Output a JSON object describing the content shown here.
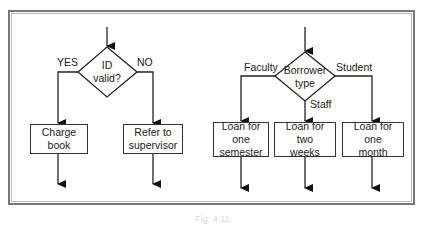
{
  "figure": {
    "caption": "Fig. 4.11",
    "colors": {
      "stroke": "#222222",
      "frame_outer": "#777777",
      "frame_inner": "#bbbbbb",
      "background": "#ffffff"
    }
  },
  "left_flowchart": {
    "decision": {
      "line1": "ID",
      "line2": "valid?"
    },
    "branches": [
      {
        "label": "YES",
        "box": {
          "line1": "Charge",
          "line2": "book"
        }
      },
      {
        "label": "NO",
        "box": {
          "line1": "Refer to",
          "line2": "supervisor"
        }
      }
    ]
  },
  "right_flowchart": {
    "decision": {
      "line1": "Borrower",
      "line2": "type"
    },
    "branches": [
      {
        "label": "Faculty",
        "box": {
          "line1": "Loan for one",
          "line2": "semester"
        }
      },
      {
        "label": "Staff",
        "box": {
          "line1": "Loan for two",
          "line2": "weeks"
        }
      },
      {
        "label": "Student",
        "box": {
          "line1": "Loan for one",
          "line2": "month"
        }
      }
    ]
  }
}
